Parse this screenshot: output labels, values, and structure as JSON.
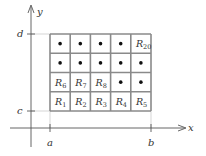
{
  "axes": {
    "x_label": "x",
    "y_label": "y",
    "x_ticks": [
      {
        "label": "a",
        "x": 50
      },
      {
        "label": "b",
        "x": 151
      }
    ],
    "y_ticks": [
      {
        "label": "d",
        "y": 34
      },
      {
        "label": "c",
        "y": 111
      }
    ]
  },
  "grid": {
    "rows": 4,
    "cols": 5,
    "left": 50,
    "top": 34,
    "right": 151,
    "bottom": 111,
    "line_color": "#8a8a8a",
    "cells": [
      [
        "dot",
        "dot",
        "dot",
        "dot",
        {
          "main": "R",
          "sub": "20"
        }
      ],
      [
        "dot",
        "dot",
        "dot",
        "dot",
        "dot"
      ],
      [
        {
          "main": "R",
          "sub": "6"
        },
        {
          "main": "R",
          "sub": "7"
        },
        {
          "main": "R",
          "sub": "8"
        },
        "dot",
        "dot"
      ],
      [
        {
          "main": "R",
          "sub": "1"
        },
        {
          "main": "R",
          "sub": "2"
        },
        {
          "main": "R",
          "sub": "3"
        },
        {
          "main": "R",
          "sub": "4"
        },
        {
          "main": "R",
          "sub": "5"
        }
      ]
    ]
  }
}
